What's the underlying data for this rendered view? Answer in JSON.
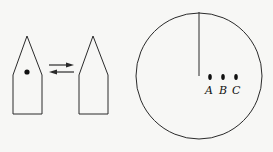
{
  "diagram": {
    "left_figure": {
      "shape": "pentagon-arrow-shape",
      "has_dot": true
    },
    "arrows": {
      "top_direction": "right",
      "bottom_direction": "left"
    },
    "right_figure": {
      "shape": "pentagon-arrow-shape",
      "has_dot": false
    },
    "circle": {
      "has_vertical_radius_line": true,
      "points": [
        {
          "label": "A"
        },
        {
          "label": "B"
        },
        {
          "label": "C"
        }
      ]
    }
  },
  "colors": {
    "stroke": "#2a2a2a",
    "background": "#f7f7f5"
  }
}
